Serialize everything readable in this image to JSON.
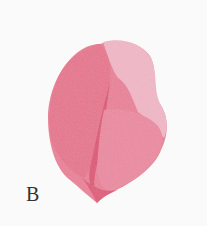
{
  "figure": {
    "label": "B",
    "colors": {
      "background": "#fbfafa",
      "main_pink": "#e9768f",
      "light_pink": "#f2b6c6",
      "dark_pink": "#e05a78",
      "mid_pink": "#ec8ba1"
    }
  }
}
